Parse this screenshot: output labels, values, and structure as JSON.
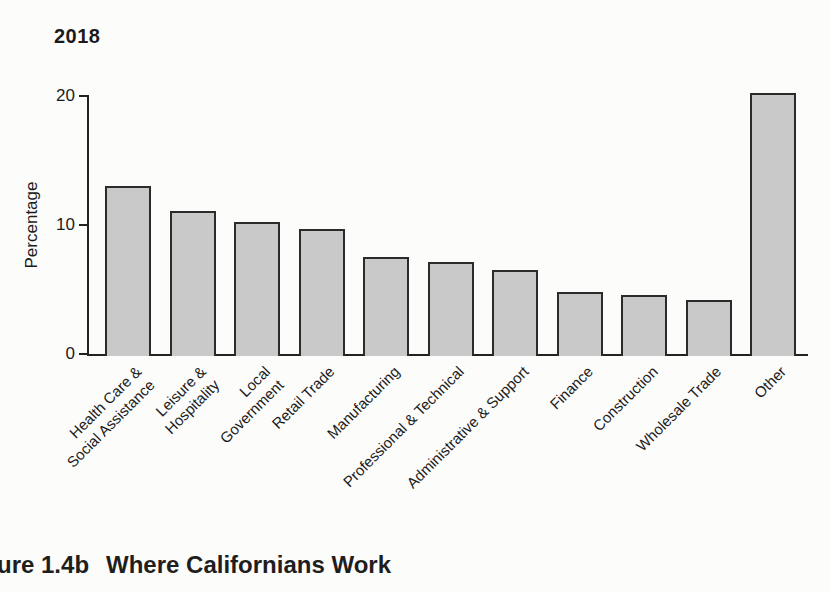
{
  "chart_data": {
    "type": "bar",
    "title": "2018",
    "ylabel": "Percentage",
    "xlabel": "",
    "ylim": [
      0,
      21
    ],
    "yticks": [
      0,
      10,
      20
    ],
    "grid": false,
    "legend": "none",
    "bar_fill_color": "#c9c9c9",
    "bar_border_color": "#2b2b2b",
    "categories": [
      "Health Care & Social Assistance",
      "Leisure & Hospitality",
      "Local Government",
      "Retail Trade",
      "Manufacturing",
      "Professional & Technical",
      "Administrative & Support",
      "Finance",
      "Construction",
      "Wholesale Trade",
      "Other"
    ],
    "category_lines": [
      [
        "Health Care &",
        "Social Assistance"
      ],
      [
        "Leisure &",
        "Hospitality"
      ],
      [
        "Local",
        "Government"
      ],
      [
        "Retail Trade"
      ],
      [
        "Manufacturing"
      ],
      [
        "Professional & Technical"
      ],
      [
        "Administrative & Support"
      ],
      [
        "Finance"
      ],
      [
        "Construction"
      ],
      [
        "Wholesale Trade"
      ],
      [
        "Other"
      ]
    ],
    "values": [
      13.0,
      11.1,
      10.2,
      9.7,
      7.5,
      7.1,
      6.5,
      4.8,
      4.6,
      4.2,
      20.2
    ]
  },
  "caption": {
    "prefix": "ure 1.4b",
    "title": "Where Californians Work"
  }
}
